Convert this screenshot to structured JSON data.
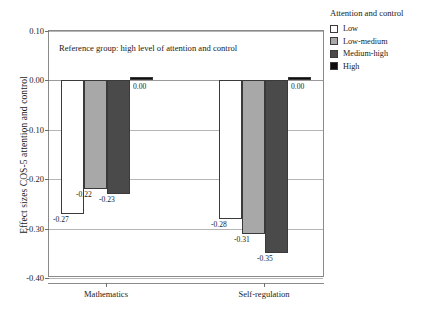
{
  "chart_data": {
    "type": "bar",
    "title": "",
    "xlabel": "",
    "ylabel": "Effect sizes COS-5 attention and control",
    "categories": [
      "Mathematics",
      "Self-regulation"
    ],
    "series": [
      {
        "name": "Low",
        "color": "#ffffff",
        "values": [
          -0.27,
          -0.28
        ],
        "labels": [
          "-0.27",
          "-0.28"
        ]
      },
      {
        "name": "Low-medium",
        "color": "#a8a8a8",
        "values": [
          -0.22,
          -0.31
        ],
        "labels": [
          "-0.22",
          "-0.31"
        ]
      },
      {
        "name": "Medium-high",
        "color": "#4a4a4a",
        "values": [
          -0.23,
          -0.35
        ],
        "labels": [
          "-0.23",
          "-0.35"
        ]
      },
      {
        "name": "High",
        "color": "#0d0d0d",
        "values": [
          0.0,
          0.0
        ],
        "labels": [
          "0.00",
          "0.00"
        ]
      }
    ],
    "ylim": [
      -0.4,
      0.1
    ],
    "yticks": [
      0.1,
      0.0,
      -0.1,
      -0.2,
      -0.3,
      -0.4
    ],
    "ytick_labels": [
      "0.10",
      "0.00",
      "-0.10",
      "-0.20",
      "-0.30",
      "-0.40"
    ],
    "grid": true,
    "legend_position": "right",
    "annotations": [
      "Reference group: high level of attention and control"
    ]
  },
  "legend": {
    "title": "Attention and control",
    "items": [
      {
        "label": "Low"
      },
      {
        "label": "Low-medium"
      },
      {
        "label": "Medium-high"
      },
      {
        "label": "High"
      }
    ]
  }
}
